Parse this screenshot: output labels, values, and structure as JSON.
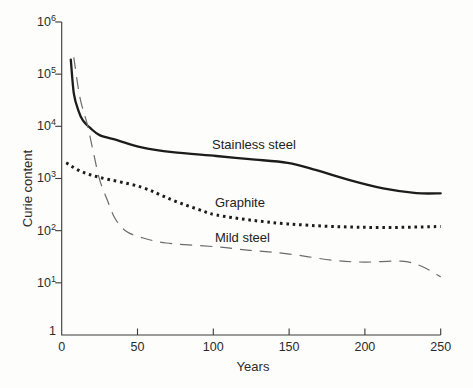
{
  "figure": {
    "ylabel": "Curie content",
    "xlabel": "Years",
    "colors": {
      "line": "#1c1c1c",
      "dashed": "#6b6b6b",
      "axis": "#3a3a3a",
      "text": "#2b2b2b",
      "background": "#fdfdfc"
    }
  },
  "chart_data": {
    "type": "line",
    "title": "",
    "xlabel": "Years",
    "ylabel": "Curie content",
    "x_axis": {
      "min": 0,
      "max": 250,
      "ticks": [
        0,
        50,
        100,
        150,
        200,
        250
      ]
    },
    "y_axis": {
      "scale": "log",
      "min": 1,
      "max": 1000000,
      "tick_exponents": [
        0,
        1,
        2,
        3,
        4,
        5,
        6
      ]
    },
    "grid": false,
    "legend": "inline labels",
    "series": [
      {
        "name": "Stainless steel",
        "style": "solid",
        "points": [
          [
            6,
            190000
          ],
          [
            8,
            43000
          ],
          [
            11,
            20000
          ],
          [
            14,
            13000
          ],
          [
            19,
            9200
          ],
          [
            25,
            6800
          ],
          [
            37,
            5400
          ],
          [
            52,
            4000
          ],
          [
            73,
            3200
          ],
          [
            102,
            2700
          ],
          [
            124,
            2350
          ],
          [
            149,
            2000
          ],
          [
            168,
            1450
          ],
          [
            190,
            930
          ],
          [
            212,
            650
          ],
          [
            234,
            525
          ],
          [
            250,
            520
          ]
        ]
      },
      {
        "name": "Graphite",
        "style": "dotted",
        "points": [
          [
            3,
            2000
          ],
          [
            12,
            1400
          ],
          [
            25,
            1050
          ],
          [
            52,
            690
          ],
          [
            73,
            385
          ],
          [
            91,
            250
          ],
          [
            102,
            200
          ],
          [
            124,
            160
          ],
          [
            149,
            135
          ],
          [
            179,
            120
          ],
          [
            212,
            115
          ],
          [
            250,
            120
          ]
        ]
      },
      {
        "name": "Mild steel",
        "style": "dashed",
        "points": [
          [
            8,
            210000
          ],
          [
            12,
            36000
          ],
          [
            17,
            10500
          ],
          [
            21,
            3100
          ],
          [
            25,
            950
          ],
          [
            30,
            390
          ],
          [
            35,
            175
          ],
          [
            42,
            100
          ],
          [
            52,
            75
          ],
          [
            69,
            58
          ],
          [
            102,
            49
          ],
          [
            124,
            42
          ],
          [
            149,
            36
          ],
          [
            179,
            27
          ],
          [
            200,
            25
          ],
          [
            224,
            26
          ],
          [
            237,
            21
          ],
          [
            250,
            13
          ]
        ]
      }
    ]
  }
}
